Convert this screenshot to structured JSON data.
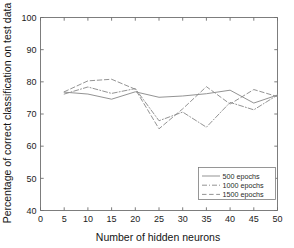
{
  "chart_data": {
    "type": "line",
    "title": "",
    "xlabel": "Number of hidden neurons",
    "ylabel": "Percentage of correct classification on test data",
    "x": [
      5,
      10,
      15,
      20,
      25,
      30,
      35,
      40,
      45,
      50
    ],
    "xlim": [
      0,
      50
    ],
    "ylim": [
      40,
      100
    ],
    "xticks": [
      0,
      5,
      10,
      15,
      20,
      25,
      30,
      35,
      40,
      45,
      50
    ],
    "yticks": [
      40,
      50,
      60,
      70,
      80,
      90,
      100
    ],
    "grid": false,
    "legend_position": "lower right",
    "series": [
      {
        "name": "500 epochs",
        "style": "solid",
        "values": [
          76.8,
          76.2,
          74.6,
          76.9,
          75.2,
          75.6,
          76.3,
          77.4,
          73.4,
          75.9
        ]
      },
      {
        "name": "1000 epochs",
        "style": "dash-dot",
        "values": [
          76.2,
          78.4,
          76.4,
          77.9,
          67.9,
          70.6,
          65.9,
          73.6,
          71.3,
          75.9
        ]
      },
      {
        "name": "1500 epochs",
        "style": "dashed",
        "values": [
          76.9,
          80.3,
          80.8,
          77.7,
          65.4,
          71.6,
          78.5,
          73.1,
          77.6,
          75.4
        ]
      }
    ]
  },
  "axes": {
    "xtick_labels": [
      "0",
      "5",
      "10",
      "15",
      "20",
      "25",
      "30",
      "35",
      "40",
      "45",
      "50"
    ],
    "ytick_labels": [
      "40",
      "50",
      "60",
      "70",
      "80",
      "90",
      "100"
    ]
  },
  "legend": {
    "entries": [
      {
        "label": "500 epochs"
      },
      {
        "label": "1000 epochs"
      },
      {
        "label": "1500 epochs"
      }
    ]
  },
  "colors": {
    "line": "#8d8d8d",
    "axis": "#6e6e6e",
    "text": "#1c1c1c",
    "background": "#ffffff"
  }
}
